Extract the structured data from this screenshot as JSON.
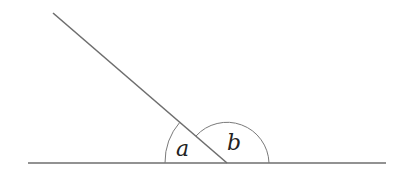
{
  "diagram": {
    "type": "angles-on-a-straight-line",
    "labels": {
      "angle_a": "a",
      "angle_b": "b"
    },
    "colors": {
      "line": "#6e6e6e",
      "arc": "#7a7a7a",
      "label": "#222222",
      "background": "#ffffff"
    }
  }
}
